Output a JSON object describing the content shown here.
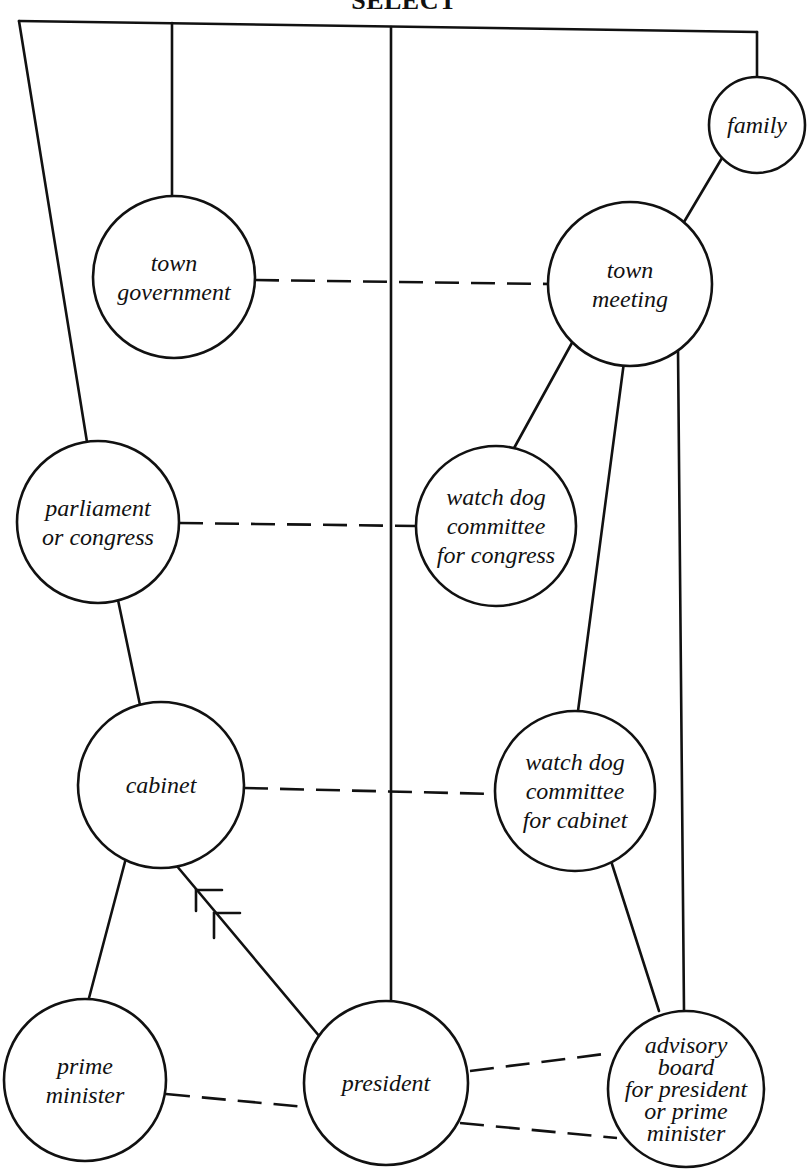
{
  "title": "SELECT",
  "colors": {
    "ink": "#111111",
    "background": "#ffffff"
  },
  "nodes": [
    {
      "id": "family",
      "lines": [
        "family"
      ],
      "cx": 757,
      "cy": 125,
      "r": 48
    },
    {
      "id": "town_government",
      "lines": [
        "town",
        "government"
      ],
      "cx": 174,
      "cy": 277,
      "r": 81
    },
    {
      "id": "town_meeting",
      "lines": [
        "town",
        "meeting"
      ],
      "cx": 630,
      "cy": 284,
      "r": 82
    },
    {
      "id": "parliament",
      "lines": [
        "parliament",
        "or congress"
      ],
      "cx": 98,
      "cy": 522,
      "r": 81
    },
    {
      "id": "watchdog_congress",
      "lines": [
        "watch dog",
        "committee",
        "for congress"
      ],
      "cx": 496,
      "cy": 526,
      "r": 80
    },
    {
      "id": "cabinet",
      "lines": [
        "cabinet"
      ],
      "cx": 161,
      "cy": 785,
      "r": 83
    },
    {
      "id": "watchdog_cabinet",
      "lines": [
        "watch dog",
        "committee",
        "for cabinet"
      ],
      "cx": 575,
      "cy": 791,
      "r": 80
    },
    {
      "id": "prime_minister",
      "lines": [
        "prime",
        "minister"
      ],
      "cx": 85,
      "cy": 1080,
      "r": 81
    },
    {
      "id": "president",
      "lines": [
        "president"
      ],
      "cx": 386,
      "cy": 1083,
      "r": 82
    },
    {
      "id": "advisory_board",
      "lines": [
        "advisory",
        "board",
        "for president",
        "or  prime",
        "minister"
      ],
      "cx": 686,
      "cy": 1089,
      "r": 78
    }
  ],
  "solid_edges": [
    {
      "name": "top-bus",
      "points": [
        [
          19,
          21
        ],
        [
          757,
          32
        ]
      ]
    },
    {
      "name": "bus-to-family",
      "points": [
        [
          757,
          32
        ],
        [
          757,
          77
        ]
      ]
    },
    {
      "name": "bus-to-parliament",
      "points": [
        [
          19,
          21
        ],
        [
          87,
          442
        ]
      ]
    },
    {
      "name": "bus-to-town-government",
      "points": [
        [
          172,
          23
        ],
        [
          172,
          197
        ]
      ]
    },
    {
      "name": "bus-to-president",
      "points": [
        [
          391,
          27
        ],
        [
          391,
          1001
        ]
      ]
    },
    {
      "name": "family-to-town-meeting",
      "points": [
        [
          722,
          158
        ],
        [
          684,
          222
        ]
      ]
    },
    {
      "name": "town-meeting-to-watchdog-congress",
      "points": [
        [
          573,
          341
        ],
        [
          513,
          450
        ]
      ]
    },
    {
      "name": "town-meeting-to-watchdog-cabinet",
      "points": [
        [
          624,
          362
        ],
        [
          578,
          711
        ]
      ]
    },
    {
      "name": "town-meeting-to-advisory-board",
      "points": [
        [
          678,
          349
        ],
        [
          684,
          1011
        ]
      ]
    },
    {
      "name": "parliament-to-cabinet",
      "points": [
        [
          118,
          600
        ],
        [
          140,
          705
        ]
      ]
    },
    {
      "name": "cabinet-to-prime-minister",
      "points": [
        [
          126,
          858
        ],
        [
          89,
          998
        ]
      ]
    },
    {
      "name": "president-to-cabinet",
      "points": [
        [
          320,
          1037
        ],
        [
          176,
          865
        ]
      ]
    },
    {
      "name": "watchdog-cabinet-to-advisory-board",
      "points": [
        [
          612,
          864
        ],
        [
          659,
          1011
        ]
      ]
    }
  ],
  "dashed_edges": [
    {
      "name": "town-government-to-town-meeting",
      "points": [
        [
          255,
          280
        ],
        [
          549,
          284
        ]
      ]
    },
    {
      "name": "parliament-to-watchdog-congress",
      "points": [
        [
          179,
          523
        ],
        [
          416,
          526
        ]
      ]
    },
    {
      "name": "cabinet-to-watchdog-cabinet",
      "points": [
        [
          244,
          788
        ],
        [
          495,
          794
        ]
      ]
    },
    {
      "name": "prime-minister-to-president",
      "points": [
        [
          166,
          1094
        ],
        [
          305,
          1107
        ]
      ]
    },
    {
      "name": "president-to-advisory-board-upper",
      "points": [
        [
          470,
          1071
        ],
        [
          612,
          1053
        ]
      ]
    },
    {
      "name": "president-to-advisory-board-lower",
      "points": [
        [
          460,
          1123
        ],
        [
          617,
          1138
        ]
      ]
    }
  ],
  "arrow_marks": [
    {
      "name": "arrowhead-1",
      "points": [
        [
          196,
          911
        ],
        [
          196,
          890
        ],
        [
          222,
          890
        ]
      ]
    },
    {
      "name": "arrowhead-2",
      "points": [
        [
          214,
          938
        ],
        [
          214,
          913
        ],
        [
          240,
          913
        ]
      ]
    }
  ]
}
